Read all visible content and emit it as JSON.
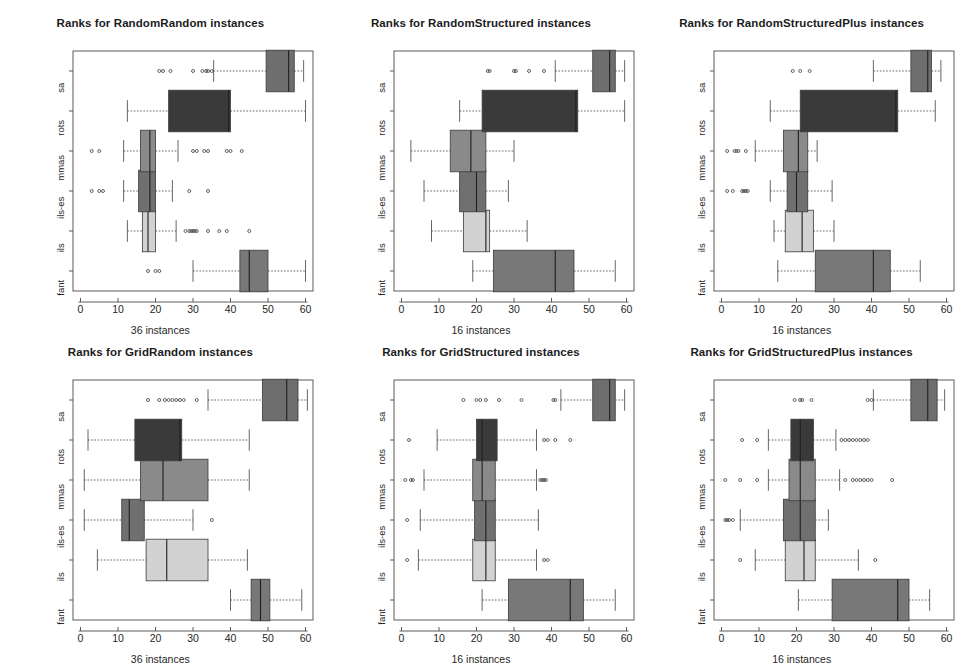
{
  "figure": {
    "width": 962,
    "height": 657,
    "background": "#ffffff",
    "grid": "3 columns x 2 rows of boxplot panels"
  },
  "colors": {
    "fant": "#787878",
    "ils": "#d2d2d2",
    "ils-es": "#707070",
    "mmas": "#8a8a8a",
    "rots": "#3a3a3a",
    "sa": "#6e6e6e",
    "box_border": "#3b3b3b",
    "axis": "#4a4a4a",
    "whisker": "#555555",
    "outlier": "#555555",
    "text": "#262626"
  },
  "axis": {
    "x_ticks": [
      0,
      10,
      20,
      30,
      40,
      50,
      60
    ],
    "x_tick_labels": [
      "0",
      "10",
      "20",
      "30",
      "40",
      "50",
      "60"
    ],
    "x_min": -2,
    "x_max": 62,
    "y_categories_bottom_to_top": [
      "fant",
      "ils",
      "ils-es",
      "mmas",
      "rots",
      "sa"
    ]
  },
  "chart_data": [
    {
      "type": "box",
      "panel_index": 0,
      "title": "Ranks for RandomRandom instances",
      "xlabel": "36 instances",
      "ylabel": "",
      "xlim": [
        -2,
        62
      ],
      "grid": false,
      "legend": "none",
      "categories": [
        "fant",
        "ils",
        "ils-es",
        "mmas",
        "rots",
        "sa"
      ],
      "boxes": [
        {
          "name": "fant",
          "whisker_lo": 30.0,
          "q1": 42.5,
          "median": 45.0,
          "q3": 50.0,
          "whisker_hi": 60.0,
          "outliers": [
            18.0,
            20.0,
            21.0
          ]
        },
        {
          "name": "ils",
          "whisker_lo": 12.5,
          "q1": 16.5,
          "median": 18.0,
          "q3": 20.0,
          "whisker_hi": 25.5,
          "outliers": [
            28.0,
            29.0,
            29.5,
            30.0,
            30.5,
            31.0,
            34.0,
            37.0,
            39.0,
            45.0
          ]
        },
        {
          "name": "ils-es",
          "whisker_lo": 11.5,
          "q1": 15.5,
          "median": 18.5,
          "q3": 20.0,
          "whisker_hi": 24.5,
          "outliers": [
            3.0,
            5.0,
            6.0,
            29.0,
            34.0
          ]
        },
        {
          "name": "mmas",
          "whisker_lo": 11.5,
          "q1": 16.0,
          "median": 18.5,
          "q3": 20.0,
          "whisker_hi": 26.0,
          "outliers": [
            3.0,
            5.0,
            30.0,
            31.0,
            33.0,
            34.0,
            39.0,
            40.0,
            43.0
          ]
        },
        {
          "name": "rots",
          "whisker_lo": 12.5,
          "q1": 23.5,
          "median": 39.5,
          "q3": 40.0,
          "whisker_hi": 60.0,
          "outliers": []
        },
        {
          "name": "sa",
          "whisker_lo": 35.5,
          "q1": 49.5,
          "median": 55.5,
          "q3": 57.0,
          "whisker_hi": 59.5,
          "outliers": [
            21.0,
            22.0,
            24.0,
            30.0,
            32.5,
            33.5,
            34.0,
            35.0
          ]
        }
      ]
    },
    {
      "type": "box",
      "panel_index": 1,
      "title": "Ranks for RandomStructured instances",
      "xlabel": "16 instances",
      "ylabel": "",
      "xlim": [
        -2,
        62
      ],
      "grid": false,
      "legend": "none",
      "categories": [
        "fant",
        "ils",
        "ils-es",
        "mmas",
        "rots",
        "sa"
      ],
      "boxes": [
        {
          "name": "fant",
          "whisker_lo": 19.0,
          "q1": 24.5,
          "median": 41.0,
          "q3": 46.0,
          "whisker_hi": 57.0,
          "outliers": []
        },
        {
          "name": "ils",
          "whisker_lo": 8.0,
          "q1": 16.5,
          "median": 22.5,
          "q3": 23.5,
          "whisker_hi": 33.5,
          "outliers": []
        },
        {
          "name": "ils-es",
          "whisker_lo": 6.0,
          "q1": 15.5,
          "median": 20.0,
          "q3": 22.5,
          "whisker_hi": 28.5,
          "outliers": []
        },
        {
          "name": "mmas",
          "whisker_lo": 2.5,
          "q1": 13.0,
          "median": 18.5,
          "q3": 22.5,
          "whisker_hi": 30.0,
          "outliers": []
        },
        {
          "name": "rots",
          "whisker_lo": 15.5,
          "q1": 21.5,
          "median": 46.5,
          "q3": 47.0,
          "whisker_hi": 59.5,
          "outliers": []
        },
        {
          "name": "sa",
          "whisker_lo": 41.0,
          "q1": 51.0,
          "median": 55.5,
          "q3": 57.0,
          "whisker_hi": 59.5,
          "outliers": [
            23.0,
            23.5,
            30.0,
            30.5,
            34.0,
            38.0
          ]
        }
      ]
    },
    {
      "type": "box",
      "panel_index": 2,
      "title": "Ranks for RandomStructuredPlus instances",
      "xlabel": "16 instances",
      "ylabel": "",
      "xlim": [
        -2,
        62
      ],
      "grid": false,
      "legend": "none",
      "categories": [
        "fant",
        "ils",
        "ils-es",
        "mmas",
        "rots",
        "sa"
      ],
      "boxes": [
        {
          "name": "fant",
          "whisker_lo": 15.0,
          "q1": 25.0,
          "median": 40.5,
          "q3": 45.0,
          "whisker_hi": 53.0,
          "outliers": []
        },
        {
          "name": "ils",
          "whisker_lo": 14.0,
          "q1": 17.0,
          "median": 21.5,
          "q3": 24.5,
          "whisker_hi": 30.0,
          "outliers": []
        },
        {
          "name": "ils-es",
          "whisker_lo": 13.0,
          "q1": 17.5,
          "median": 20.0,
          "q3": 23.0,
          "whisker_hi": 29.5,
          "outliers": [
            1.5,
            3.0,
            5.5,
            6.0,
            6.5,
            7.0
          ]
        },
        {
          "name": "mmas",
          "whisker_lo": 9.0,
          "q1": 16.5,
          "median": 20.5,
          "q3": 23.0,
          "whisker_hi": 25.5,
          "outliers": [
            1.5,
            3.5,
            4.0,
            4.5,
            6.5
          ]
        },
        {
          "name": "rots",
          "whisker_lo": 13.0,
          "q1": 21.0,
          "median": 46.5,
          "q3": 47.0,
          "whisker_hi": 57.0,
          "outliers": []
        },
        {
          "name": "sa",
          "whisker_lo": 40.5,
          "q1": 50.5,
          "median": 55.0,
          "q3": 56.0,
          "whisker_hi": 58.5,
          "outliers": [
            19.0,
            21.0,
            23.5
          ]
        }
      ]
    },
    {
      "type": "box",
      "panel_index": 3,
      "title": "Ranks for GridRandom instances",
      "xlabel": "36 instances",
      "ylabel": "",
      "xlim": [
        -2,
        62
      ],
      "grid": false,
      "legend": "none",
      "categories": [
        "fant",
        "ils",
        "ils-es",
        "mmas",
        "rots",
        "sa"
      ],
      "boxes": [
        {
          "name": "fant",
          "whisker_lo": 40.0,
          "q1": 45.5,
          "median": 48.0,
          "q3": 50.5,
          "whisker_hi": 59.0,
          "outliers": []
        },
        {
          "name": "ils",
          "whisker_lo": 4.5,
          "q1": 17.5,
          "median": 23.0,
          "q3": 34.0,
          "whisker_hi": 44.5,
          "outliers": []
        },
        {
          "name": "ils-es",
          "whisker_lo": 1.0,
          "q1": 11.0,
          "median": 13.0,
          "q3": 17.0,
          "whisker_hi": 30.0,
          "outliers": [
            35.0
          ]
        },
        {
          "name": "mmas",
          "whisker_lo": 1.0,
          "q1": 16.0,
          "median": 22.0,
          "q3": 34.0,
          "whisker_hi": 45.0,
          "outliers": []
        },
        {
          "name": "rots",
          "whisker_lo": 2.0,
          "q1": 14.5,
          "median": 26.5,
          "q3": 27.0,
          "whisker_hi": 45.0,
          "outliers": []
        },
        {
          "name": "sa",
          "whisker_lo": 34.0,
          "q1": 48.5,
          "median": 55.0,
          "q3": 58.0,
          "whisker_hi": 60.5,
          "outliers": [
            18.0,
            21.0,
            22.5,
            23.5,
            24.5,
            25.5,
            26.5,
            27.5,
            31.0
          ]
        }
      ]
    },
    {
      "type": "box",
      "panel_index": 4,
      "title": "Ranks for GridStructured instances",
      "xlabel": "16 instances",
      "ylabel": "",
      "xlim": [
        -2,
        62
      ],
      "grid": false,
      "legend": "none",
      "categories": [
        "fant",
        "ils",
        "ils-es",
        "mmas",
        "rots",
        "sa"
      ],
      "boxes": [
        {
          "name": "fant",
          "whisker_lo": 21.5,
          "q1": 28.5,
          "median": 45.0,
          "q3": 48.5,
          "whisker_hi": 57.0,
          "outliers": []
        },
        {
          "name": "ils",
          "whisker_lo": 4.5,
          "q1": 19.0,
          "median": 22.5,
          "q3": 25.0,
          "whisker_hi": 36.0,
          "outliers": [
            1.5,
            38.0,
            39.0
          ]
        },
        {
          "name": "ils-es",
          "whisker_lo": 5.0,
          "q1": 19.5,
          "median": 22.5,
          "q3": 25.0,
          "whisker_hi": 36.5,
          "outliers": [
            1.5
          ]
        },
        {
          "name": "mmas",
          "whisker_lo": 6.0,
          "q1": 19.0,
          "median": 21.5,
          "q3": 25.0,
          "whisker_hi": 36.0,
          "outliers": [
            1.0,
            2.5,
            3.0,
            37.0,
            37.5,
            38.0,
            38.5
          ]
        },
        {
          "name": "rots",
          "whisker_lo": 9.5,
          "q1": 20.0,
          "median": 21.5,
          "q3": 25.5,
          "whisker_hi": 36.0,
          "outliers": [
            2.0,
            38.0,
            39.0,
            41.0,
            45.0
          ]
        },
        {
          "name": "sa",
          "whisker_lo": 42.5,
          "q1": 51.0,
          "median": 55.5,
          "q3": 57.0,
          "whisker_hi": 59.5,
          "outliers": [
            16.5,
            20.0,
            21.0,
            22.5,
            26.0,
            32.0,
            40.5,
            41.0
          ]
        }
      ]
    },
    {
      "type": "box",
      "panel_index": 5,
      "title": "Ranks for GridStructuredPlus instances",
      "xlabel": "16 instances",
      "ylabel": "",
      "xlim": [
        -2,
        62
      ],
      "grid": false,
      "legend": "none",
      "categories": [
        "fant",
        "ils",
        "ils-es",
        "mmas",
        "rots",
        "sa"
      ],
      "boxes": [
        {
          "name": "fant",
          "whisker_lo": 20.5,
          "q1": 29.5,
          "median": 47.0,
          "q3": 50.0,
          "whisker_hi": 55.5,
          "outliers": []
        },
        {
          "name": "ils",
          "whisker_lo": 9.0,
          "q1": 17.0,
          "median": 22.0,
          "q3": 25.0,
          "whisker_hi": 36.5,
          "outliers": [
            5.0,
            41.0
          ]
        },
        {
          "name": "ils-es",
          "whisker_lo": 5.0,
          "q1": 16.5,
          "median": 21.0,
          "q3": 25.0,
          "whisker_hi": 28.5,
          "outliers": [
            1.0,
            1.5,
            2.0,
            3.0
          ]
        },
        {
          "name": "mmas",
          "whisker_lo": 12.5,
          "q1": 18.0,
          "median": 21.0,
          "q3": 25.0,
          "whisker_hi": 31.5,
          "outliers": [
            1.0,
            5.0,
            9.5,
            33.0,
            35.0,
            36.0,
            37.0,
            38.0,
            39.0,
            40.0,
            45.5
          ]
        },
        {
          "name": "rots",
          "whisker_lo": 12.5,
          "q1": 18.5,
          "median": 21.0,
          "q3": 24.5,
          "whisker_hi": 30.5,
          "outliers": [
            5.5,
            9.5,
            32.0,
            33.0,
            34.0,
            35.0,
            36.0,
            37.0,
            38.0,
            39.0
          ]
        },
        {
          "name": "sa",
          "whisker_lo": 40.5,
          "q1": 50.5,
          "median": 55.0,
          "q3": 57.5,
          "whisker_hi": 59.5,
          "outliers": [
            19.5,
            21.0,
            21.5,
            24.0,
            39.0,
            40.0
          ]
        }
      ]
    }
  ]
}
